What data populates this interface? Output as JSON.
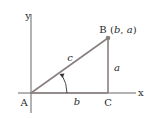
{
  "diagram": {
    "type": "right-triangle-on-axes",
    "axes": {
      "x_label": "x",
      "y_label": "y"
    },
    "points": {
      "A": {
        "label": "A"
      },
      "B": {
        "label": "B",
        "coords": "(b, a)",
        "coords_b": "b",
        "coords_a": "a"
      },
      "C": {
        "label": "C"
      }
    },
    "sides": {
      "hypotenuse": "c",
      "vertical": "a",
      "horizontal": "b"
    },
    "angle_marker": "counterclockwise-arc-at-A",
    "colors": {
      "triangle": "#8a7f7f",
      "axes": "#555555",
      "point": "#8a7f7f",
      "text": "#2a2a2a"
    }
  }
}
